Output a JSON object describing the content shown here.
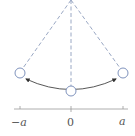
{
  "diagram": {
    "type": "pendulum",
    "colors": {
      "dashed_lines": "#9aa8c4",
      "bob_stroke": "#7f93bd",
      "arc": "#444444",
      "axis": "#999999",
      "labels": "#555555"
    },
    "pivot": {
      "x": 71,
      "y": 0
    },
    "bobs": [
      {
        "name": "left",
        "x": 20,
        "y": 73
      },
      {
        "name": "center",
        "x": 71,
        "y": 91
      },
      {
        "name": "right",
        "x": 123,
        "y": 73
      }
    ],
    "axis": {
      "ticks": [
        {
          "label": "−a",
          "x": 20
        },
        {
          "label": "0",
          "x": 71
        },
        {
          "label": "a",
          "x": 123
        }
      ]
    }
  }
}
